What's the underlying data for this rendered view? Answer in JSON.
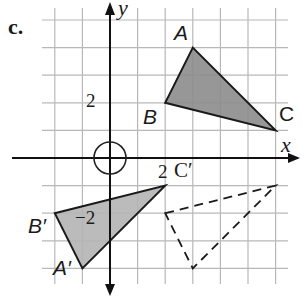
{
  "part_label": "c.",
  "axes": {
    "x_label": "x",
    "y_label": "y",
    "tick_labels": {
      "x_pos": "2",
      "y_pos": "2",
      "y_neg": "−2"
    }
  },
  "grid": {
    "origin_px": [
      110,
      158
    ],
    "cell_px": 27.6,
    "x_range": [
      -2,
      6
    ],
    "y_range": [
      -4,
      5
    ]
  },
  "triangles": {
    "original": {
      "style": "shaded",
      "fill": "#8c8c8c",
      "vertices": [
        {
          "label": "A",
          "x": 3,
          "y": 4
        },
        {
          "label": "B",
          "x": 2,
          "y": 2
        },
        {
          "label": "C",
          "x": 6,
          "y": 1
        }
      ]
    },
    "image": {
      "style": "shaded",
      "fill": "#b4b4b4",
      "vertices": [
        {
          "label": "A′",
          "x": -1,
          "y": -4
        },
        {
          "label": "B′",
          "x": -2,
          "y": -2
        },
        {
          "label": "C′",
          "x": 2,
          "y": -1
        }
      ]
    },
    "dashed": {
      "style": "dashed",
      "vertices": [
        {
          "x": 2,
          "y": -2
        },
        {
          "x": 6,
          "y": -1
        },
        {
          "x": 3,
          "y": -4
        }
      ]
    }
  },
  "origin_marker": "circle"
}
